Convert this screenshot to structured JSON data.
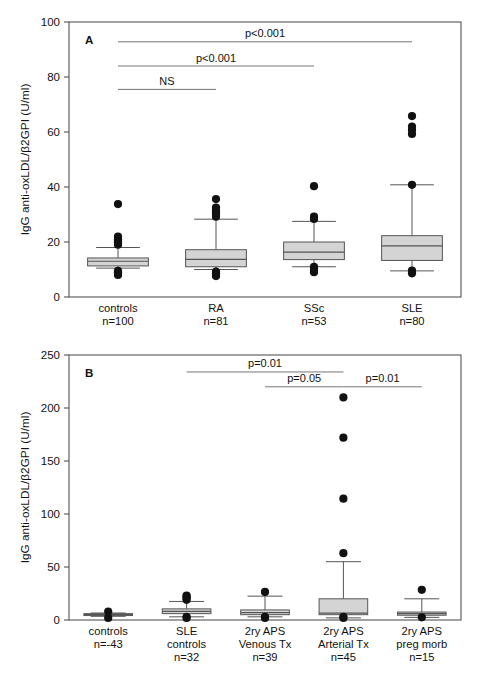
{
  "figure": {
    "background": "#ffffff",
    "box_fill": "#d4d4d4",
    "line_color": "#555555",
    "marker_color": "#111111"
  },
  "chart_data": [
    {
      "type": "box",
      "panel_label": "A",
      "title": "",
      "xlabel": "",
      "ylabel": "IgG anti-oxLDL/β2GPI (U/ml)",
      "ylim": [
        0,
        100
      ],
      "yticks": [
        0,
        20,
        40,
        60,
        80,
        100
      ],
      "ytick_labels": [
        "0",
        "20",
        "40",
        "60",
        "80",
        "100"
      ],
      "grid": false,
      "legend": "none",
      "categories": [
        "controls",
        "RA",
        "SSc",
        "SLE"
      ],
      "category_sublabels": [
        "n=100",
        "n=81",
        "n=53",
        "n=80"
      ],
      "boxes": [
        {
          "name": "controls",
          "whisker_low": 10.5,
          "q1": 11.3,
          "median": 13.0,
          "q3": 14.2,
          "whisker_high": 18.0,
          "outliers": [
            33.8,
            22.0,
            21.0,
            20.3,
            19.6,
            19.0,
            9.5,
            9.0,
            8.5,
            8.0
          ]
        },
        {
          "name": "RA",
          "whisker_low": 10.0,
          "q1": 11.0,
          "median": 13.7,
          "q3": 17.2,
          "whisker_high": 28.3,
          "outliers": [
            35.6,
            32.5,
            31.5,
            30.8,
            30.0,
            29.2,
            9.2,
            8.6,
            8.0,
            7.6
          ]
        },
        {
          "name": "SSc",
          "whisker_low": 11.0,
          "q1": 13.6,
          "median": 16.3,
          "q3": 20.0,
          "whisker_high": 27.5,
          "outliers": [
            40.3,
            29.2,
            28.4,
            11.0,
            10.3,
            9.6,
            9.0
          ]
        },
        {
          "name": "SLE",
          "whisker_low": 9.5,
          "q1": 13.3,
          "median": 18.6,
          "q3": 22.3,
          "whisker_high": 40.8,
          "outliers": [
            65.8,
            62.0,
            60.8,
            59.3,
            40.8,
            9.6,
            8.6
          ]
        }
      ],
      "annotations": [
        {
          "label": "NS",
          "from": "controls",
          "to": "RA",
          "y": 75.5
        },
        {
          "label": "p<0.001",
          "from": "controls",
          "to": "SSc",
          "y": 84.0
        },
        {
          "label": "p<0.001",
          "from": "controls",
          "to": "SLE",
          "y": 92.8
        }
      ]
    },
    {
      "type": "box",
      "panel_label": "B",
      "title": "",
      "xlabel": "",
      "ylabel": "IgG anti-oxLDL/β2GPI (U/ml)",
      "ylim": [
        0,
        250
      ],
      "yticks": [
        0,
        50,
        100,
        150,
        200,
        250
      ],
      "ytick_labels": [
        "0",
        "50",
        "100",
        "150",
        "200",
        "250"
      ],
      "grid": false,
      "legend": "none",
      "categories": [
        "controls",
        "SLE controls",
        "2ry APS Venous Tx",
        "2ry APS Arterial Tx",
        "2ry APS preg morb"
      ],
      "category_lines": [
        [
          "controls",
          "n=-43"
        ],
        [
          "SLE",
          "controls",
          "n=32"
        ],
        [
          "2ry APS",
          "Venous Tx",
          "n=39"
        ],
        [
          "2ry APS",
          "Arterial Tx",
          "n=45"
        ],
        [
          "2ry APS",
          "preg morb",
          "n=15"
        ]
      ],
      "boxes": [
        {
          "name": "controls",
          "whisker_low": 3.5,
          "q1": 4.2,
          "median": 5.2,
          "q3": 6.0,
          "whisker_high": 6.6,
          "outliers": [
            8.0,
            2.0
          ]
        },
        {
          "name": "SLE controls",
          "whisker_low": 3.0,
          "q1": 6.0,
          "median": 8.2,
          "q3": 10.5,
          "whisker_high": 17.5,
          "outliers": [
            23.0,
            22.0,
            20.5,
            19.0,
            3.0,
            2.0
          ]
        },
        {
          "name": "2ry APS Venous Tx",
          "whisker_low": 3.0,
          "q1": 5.0,
          "median": 7.0,
          "q3": 9.5,
          "whisker_high": 22.5,
          "outliers": [
            26.5,
            3.0,
            2.0
          ]
        },
        {
          "name": "2ry APS Arterial Tx",
          "whisker_low": 2.0,
          "q1": 5.0,
          "median": 6.5,
          "q3": 20.0,
          "whisker_high": 55.0,
          "outliers": [
            210.0,
            172.0,
            114.5,
            63.0,
            3.0,
            2.0
          ]
        },
        {
          "name": "2ry APS preg morb",
          "whisker_low": 2.5,
          "q1": 4.5,
          "median": 6.0,
          "q3": 7.5,
          "whisker_high": 20.0,
          "outliers": [
            28.5,
            2.5
          ]
        }
      ],
      "annotations": [
        {
          "label": "p=0.01",
          "from": "SLE controls",
          "to": "2ry APS Arterial Tx",
          "y": 234.0
        },
        {
          "label": "p=0.05",
          "from": "2ry APS Venous Tx",
          "to": "2ry APS Arterial Tx",
          "y": 220.0
        },
        {
          "label": "p=0.01",
          "from": "2ry APS Arterial Tx",
          "to": "2ry APS preg morb",
          "y": 220.0
        }
      ]
    }
  ]
}
